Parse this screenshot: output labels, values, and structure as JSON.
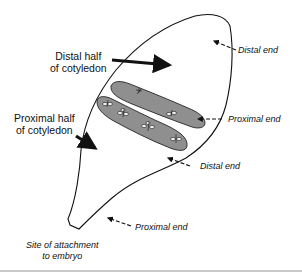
{
  "figure": {
    "type": "cotyledon-explant-diagram",
    "colors": {
      "outline": "#111111",
      "strip_fill": "#8f8f8f",
      "arrow": "#111111",
      "rule": "#c9c9c9"
    }
  },
  "labels": {
    "distal_half": {
      "line1": "Distal half",
      "line2": "of cotyledon"
    },
    "proximal_half": {
      "line1": "Proximal half",
      "line2": "of cotyledon"
    },
    "cotyledon_distal_end": "Distal end",
    "strip_proximal_end": "Proximal end",
    "strip_distal_end": "Distal end",
    "cotyledon_proximal_end": "Proximal end",
    "attachment_site": {
      "line1": "Site of attachment",
      "line2": "to embryo"
    }
  }
}
